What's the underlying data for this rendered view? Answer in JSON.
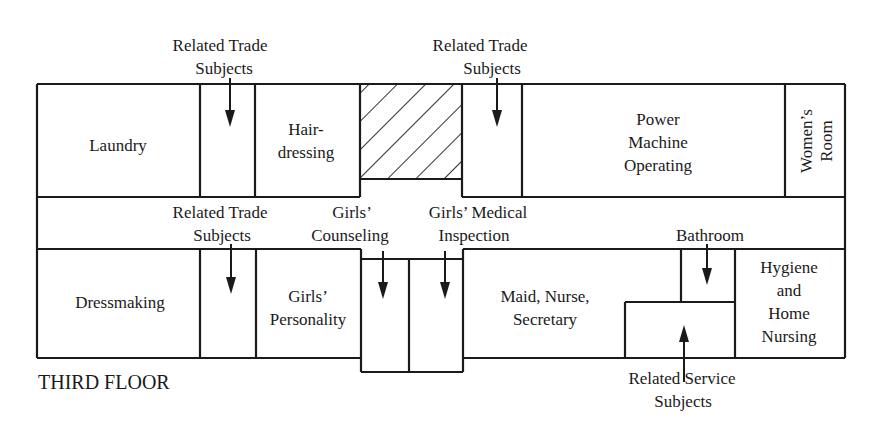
{
  "floor_label": "THIRD FLOOR",
  "rooms": {
    "laundry": "Laundry",
    "hairdressing": [
      "Hair-",
      "dressing"
    ],
    "power_machine": [
      "Power",
      "Machine",
      "Operating"
    ],
    "womens_room": [
      "Women’s",
      "Room"
    ],
    "dressmaking": "Dressmaking",
    "girls_personality": [
      "Girls’",
      "Personality"
    ],
    "maid_nurse": [
      "Maid, Nurse,",
      "Secretary"
    ],
    "hygiene": [
      "Hygiene",
      "and",
      "Home",
      "Nursing"
    ]
  },
  "callouts": {
    "related_trade_top_left": [
      "Related Trade",
      "Subjects"
    ],
    "related_trade_top_mid": [
      "Related Trade",
      "Subjects"
    ],
    "related_trade_lower": [
      "Related Trade",
      "Subjects"
    ],
    "girls_counseling": [
      "Girls’",
      "Counseling"
    ],
    "girls_medical": [
      "Girls’ Medical",
      "Inspection"
    ],
    "bathroom": "Bathroom",
    "related_service": [
      "Related Service",
      "Subjects"
    ]
  },
  "hatched_area": "stairwell (hatched)"
}
